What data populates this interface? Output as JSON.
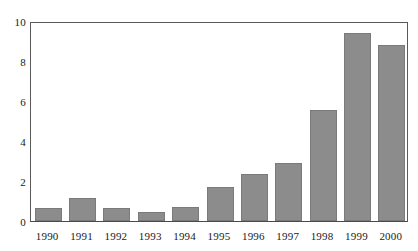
{
  "chart_data": {
    "type": "bar",
    "title": "",
    "subtitle": "",
    "xlabel": "",
    "ylabel": "",
    "categories": [
      "1990",
      "1991",
      "1992",
      "1993",
      "1994",
      "1995",
      "1996",
      "1997",
      "1998",
      "1999",
      "2000"
    ],
    "values": [
      0.65,
      1.15,
      0.65,
      0.45,
      0.7,
      1.7,
      2.35,
      2.9,
      5.55,
      9.4,
      8.8
    ],
    "ylim": [
      0,
      10
    ],
    "yticks": [
      0,
      2,
      4,
      6,
      8,
      10
    ],
    "ytick_labels": [
      "0",
      "2",
      "4",
      "6",
      "8",
      "10"
    ],
    "grid": false,
    "legend": null,
    "bar_color": "#8c8c8c",
    "bar_edge_color": "#7a7a7a",
    "axis_color": "#5a5a5a",
    "background_color": "#ffffff"
  }
}
